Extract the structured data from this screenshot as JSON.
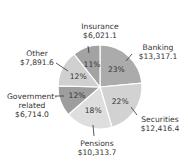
{
  "chart_data": {
    "type": "pie",
    "title": "",
    "start_angle_deg": 0,
    "direction": "clockwise",
    "slices": [
      {
        "label": "Banking",
        "value": 13317.1,
        "value_text": "$13,317.1",
        "percent": "23%",
        "color": "#ababab"
      },
      {
        "label": "Securities",
        "value": 12416.4,
        "value_text": "$12,416.4",
        "percent": "22%",
        "color": "#d2d2d2"
      },
      {
        "label": "Pensions",
        "value": 10313.7,
        "value_text": "$10,313.7",
        "percent": "18%",
        "color": "#dedede"
      },
      {
        "label": "Government-related",
        "value": 6714.0,
        "value_text": "$6,714.0",
        "percent": "12%",
        "color": "#9e9e9e"
      },
      {
        "label": "Other",
        "value": 7891.6,
        "value_text": "$7,891.6",
        "percent": "12%",
        "color": "#d0d0d0"
      },
      {
        "label": "Insurance",
        "value": 6021.1,
        "value_text": "$6,021.1",
        "percent": "11%",
        "color": "#a3a3a3"
      }
    ]
  },
  "labels": {
    "banking": {
      "name": "Banking",
      "value": "$13,317.1"
    },
    "securities": {
      "name": "Securities",
      "value": "$12,416.4"
    },
    "pensions": {
      "name": "Pensions",
      "value": "$10,313.7"
    },
    "government": {
      "name1": "Government-",
      "name2": "related",
      "value": "$6,714.0"
    },
    "other": {
      "name": "Other",
      "value": "$7,891.6"
    },
    "insurance": {
      "name": "Insurance",
      "value": "$6,021.1"
    }
  }
}
